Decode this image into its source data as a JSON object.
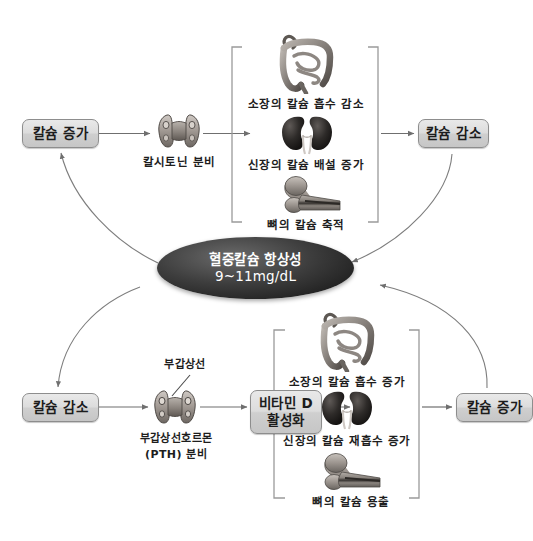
{
  "diagram": {
    "hub": {
      "line1": "혈중칼슘 항상성",
      "line2": "9~11mg/dL"
    },
    "upper_pathway": {
      "trigger_label": "칼슘 증가",
      "gland_caption": "칼시토닌 분비",
      "effects": [
        {
          "icon": "intestine-icon",
          "label": "소장의 칼슘 흡수 감소"
        },
        {
          "icon": "kidney-icon",
          "label": "신장의 칼슘 배설 증가"
        },
        {
          "icon": "bone-icon",
          "label": "뼈의 칼슘 축적"
        }
      ],
      "result_label": "칼슘 감소"
    },
    "lower_pathway": {
      "trigger_label": "칼슘 감소",
      "gland_pointer_label": "부갑상선",
      "gland_caption_line1": "부갑상선호르몬",
      "gland_caption_line2": "(PTH) 분비",
      "mediator_line1": "비타민 D",
      "mediator_line2": "활성화",
      "effects": [
        {
          "icon": "intestine-icon",
          "label": "소장의 칼슘 흡수 증가"
        },
        {
          "icon": "kidney-icon",
          "label": "신장의 칼슘 재흡수 증가"
        },
        {
          "icon": "bone-icon",
          "label": "뼈의 칼슘 용출"
        }
      ],
      "result_label": "칼슘 증가"
    },
    "colors": {
      "box_border": "#8d8d8d",
      "box_fill": "#dcdcdc",
      "hub_fill": "#232323",
      "hub_text": "#ffffff",
      "arrow": "#6f6f6f",
      "bracket": "#9a9a9a",
      "text": "#1d1d1d",
      "background": "#ffffff"
    }
  }
}
